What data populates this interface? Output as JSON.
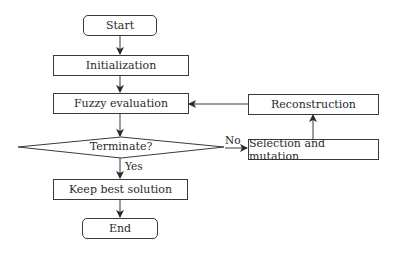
{
  "diagram": {
    "type": "flowchart",
    "nodes": {
      "start": {
        "label": "Start",
        "shape": "terminal"
      },
      "init": {
        "label": "Initialization",
        "shape": "process"
      },
      "fuzzy": {
        "label": "Fuzzy evaluation",
        "shape": "process"
      },
      "terminate": {
        "label": "Terminate?",
        "shape": "decision"
      },
      "keep": {
        "label": "Keep best solution",
        "shape": "process"
      },
      "end": {
        "label": "End",
        "shape": "terminal"
      },
      "selection": {
        "label": "Selection and mutation",
        "shape": "process"
      },
      "reconstruction": {
        "label": "Reconstruction",
        "shape": "process"
      }
    },
    "edge_labels": {
      "yes": "Yes",
      "no": "No"
    },
    "edges": [
      {
        "from": "start",
        "to": "init"
      },
      {
        "from": "init",
        "to": "fuzzy"
      },
      {
        "from": "fuzzy",
        "to": "terminate"
      },
      {
        "from": "terminate",
        "to": "keep",
        "label": "Yes"
      },
      {
        "from": "keep",
        "to": "end"
      },
      {
        "from": "terminate",
        "to": "selection",
        "label": "No"
      },
      {
        "from": "selection",
        "to": "reconstruction"
      },
      {
        "from": "reconstruction",
        "to": "fuzzy"
      }
    ]
  }
}
